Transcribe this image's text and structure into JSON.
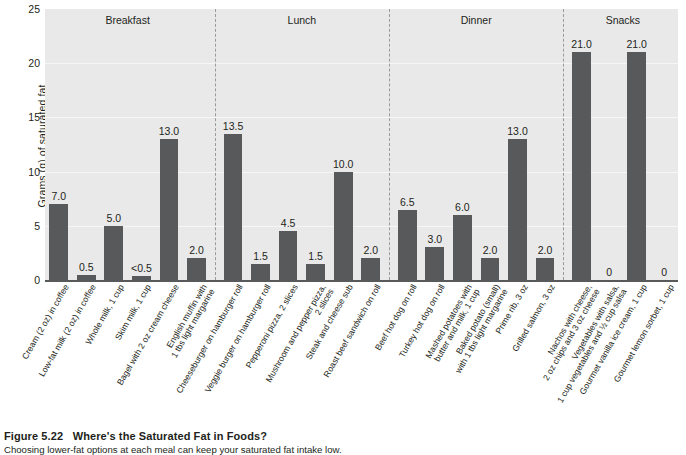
{
  "caption": {
    "figure_number": "Figure 5.22",
    "title": "Where's the Saturated Fat in Foods?",
    "body": "Choosing lower-fat options at each meal can keep your saturated fat intake low."
  },
  "chart_data": {
    "type": "bar",
    "title": "Where's the Saturated Fat in Foods?",
    "xlabel": "",
    "ylabel": "Grams (g) of saturated fat",
    "ylim": [
      0,
      25
    ],
    "yticks": [
      0,
      5,
      10,
      15,
      20,
      25
    ],
    "grid": true,
    "legend": "none",
    "bar_color": "#58595b",
    "plot_background": "#e9e9e9",
    "groups": [
      {
        "name": "Breakfast",
        "categories": [
          "Cream (2 oz) in coffee",
          "Low-fat milk (2 oz) in coffee",
          "Whole milk, 1 cup",
          "Skim milk, 1 cup",
          "Bagel with 2 oz cream cheese",
          "English muffin with 1 tbs light margarine"
        ],
        "values": [
          7.0,
          0.5,
          5.0,
          0.4,
          13.0,
          2.0
        ],
        "labels": [
          "7.0",
          "0.5",
          "5.0",
          "<0.5",
          "13.0",
          "2.0"
        ]
      },
      {
        "name": "Lunch",
        "categories": [
          "Cheeseburger on hamburger roll",
          "Veggie burger on hamburger roll",
          "Pepperoni pizza, 2 slices",
          "Mushroom and pepper pizza, 2 slices",
          "Steak and cheese sub",
          "Roast beef sandwich on roll"
        ],
        "values": [
          13.5,
          1.5,
          4.5,
          1.5,
          10.0,
          2.0
        ],
        "labels": [
          "13.5",
          "1.5",
          "4.5",
          "1.5",
          "10.0",
          "2.0"
        ]
      },
      {
        "name": "Dinner",
        "categories": [
          "Beef hot dog on roll",
          "Turkey hot dog on roll",
          "Mashed potatoes with butter and milk, 1 cup",
          "Baked potato (small) with 1 tbs light margarine",
          "Prime rib, 3 oz",
          "Grilled salmon, 3 oz"
        ],
        "values": [
          6.5,
          3.0,
          6.0,
          2.0,
          13.0,
          2.0
        ],
        "labels": [
          "6.5",
          "3.0",
          "6.0",
          "2.0",
          "13.0",
          "2.0"
        ]
      },
      {
        "name": "Snacks",
        "categories": [
          "Nachos with cheese, 2 oz chips and 3 oz cheese",
          "Vegetables with salsa, 1 cup vegetables and ½ cup salsa",
          "Gourmet vanilla ice cream, 1 cup",
          "Gourmet lemon sorbet, 1 cup"
        ],
        "values": [
          21.0,
          0,
          21.0,
          0
        ],
        "labels": [
          "21.0",
          "0",
          "21.0",
          "0"
        ]
      }
    ],
    "x_label_lines": [
      [
        "Cream (2 oz) in coffee",
        ""
      ],
      [
        "Low-fat milk (2 oz) in coffee",
        ""
      ],
      [
        "Whole milk, 1 cup",
        ""
      ],
      [
        "Skim milk, 1 cup",
        ""
      ],
      [
        "Bagel with 2 oz cream cheese",
        ""
      ],
      [
        "English muffin with",
        "1 tbs light margarine"
      ],
      [
        "Cheeseburger on hamburger roll",
        ""
      ],
      [
        "Veggie burger on hamburger roll",
        ""
      ],
      [
        "Pepperoni pizza, 2 slices",
        ""
      ],
      [
        "Mushroom and pepper pizza,",
        "2 slices"
      ],
      [
        "Steak and cheese sub",
        ""
      ],
      [
        "Roast beef sandwich on roll",
        ""
      ],
      [
        "Beef hot dog on roll",
        ""
      ],
      [
        "Turkey hot dog on roll",
        ""
      ],
      [
        "Mashed potatoes with",
        "butter and milk, 1 cup"
      ],
      [
        "Baked potato (small)",
        "with 1 tbs light margarine"
      ],
      [
        "Prime rib, 3 oz",
        ""
      ],
      [
        "Grilled salmon, 3 oz",
        ""
      ],
      [
        "Nachos with cheese,",
        "2 oz chips and 3 oz cheese"
      ],
      [
        "Vegetables with salsa,",
        "1 cup vegetables and ½ cup salsa"
      ],
      [
        "Gourmet vanilla ice cream, 1 cup",
        ""
      ],
      [
        "Gourmet lemon sorbet, 1 cup",
        ""
      ]
    ]
  }
}
